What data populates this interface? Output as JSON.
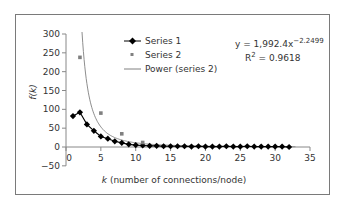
{
  "chart_data": {
    "type": "scatter",
    "title": "",
    "xlabel_italic": "k",
    "xlabel_rest": " (number of connections/node)",
    "xlabel": "k (number of connections/node)",
    "ylabel": "f(k)",
    "xlim": [
      0,
      35
    ],
    "ylim": [
      -50,
      300
    ],
    "x_ticks": [
      0,
      5,
      10,
      15,
      20,
      25,
      30,
      35
    ],
    "y_ticks": [
      -50,
      0,
      50,
      100,
      150,
      200,
      250,
      300
    ],
    "grid": false,
    "legend_position": "upper-center",
    "series": [
      {
        "name": "Series 1",
        "style": "line-with-diamond-markers",
        "color": "#000000",
        "x": [
          1,
          2,
          3,
          4,
          5,
          6,
          7,
          8,
          9,
          10,
          11,
          12,
          13,
          14,
          15,
          16,
          17,
          18,
          19,
          20,
          21,
          22,
          23,
          24,
          25,
          26,
          27,
          28,
          29,
          30,
          31,
          32
        ],
        "values": [
          82,
          92,
          60,
          43,
          28,
          22,
          15,
          11,
          7,
          5,
          4,
          3,
          3,
          2,
          2,
          2,
          2,
          1,
          2,
          1,
          1,
          1,
          2,
          1,
          1,
          2,
          1,
          1,
          1,
          1,
          1,
          0
        ]
      },
      {
        "name": "Series 2",
        "style": "square-markers",
        "color": "#808080",
        "x": [
          2,
          5,
          8,
          11
        ],
        "values": [
          238,
          90,
          35,
          12
        ]
      },
      {
        "name": "Power (series 2)",
        "style": "line",
        "color": "#808080",
        "equation": "y = 1992.4 x^-2.2499",
        "coefficient": 1992.4,
        "exponent": -2.2499
      }
    ],
    "annotations": [
      "y = 1,992.4x^-2.2499",
      "R^2 = 0.9618"
    ]
  },
  "legend": {
    "items": [
      "Series 1",
      "Series 2",
      "Power (series 2)"
    ]
  },
  "equation": {
    "lhs": "y = 1,992.4x",
    "exp": "−2.2499",
    "r2_label": "R",
    "r2_sup": "2",
    "r2_value": " = 0.9618"
  }
}
